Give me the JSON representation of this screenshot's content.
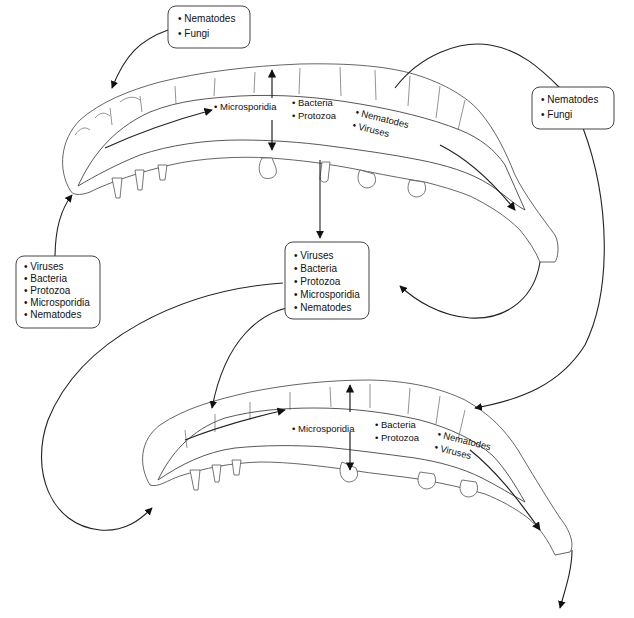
{
  "boxes": {
    "top_left": {
      "items": [
        "Nematodes",
        "Fungi"
      ]
    },
    "right": {
      "items": [
        "Nematodes",
        "Fungi"
      ]
    },
    "left": {
      "items": [
        "Viruses",
        "Bacteria",
        "Protozoa",
        "Microsporidia",
        "Nematodes"
      ]
    },
    "center": {
      "items": [
        "Viruses",
        "Bacteria",
        "Protozoa",
        "Microsporidia",
        "Nematodes"
      ]
    }
  },
  "larva_upper": {
    "gut_labels": {
      "microsporidia": "Microsporidia",
      "bacteria": "Bacteria",
      "protozoa": "Protozoa",
      "nematodes": "Nematodes",
      "viruses": "Viruses"
    }
  },
  "larva_lower": {
    "gut_labels": {
      "microsporidia": "Microsporidia",
      "bacteria": "Bacteria",
      "protozoa": "Protozoa",
      "nematodes": "Nematodes",
      "viruses": "Viruses"
    }
  },
  "bullet": "•"
}
